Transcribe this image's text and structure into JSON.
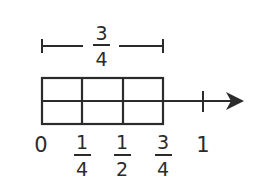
{
  "diagram": {
    "type": "fraction-number-line-with-area-model",
    "measure_bracket": {
      "numerator": "3",
      "denominator": "4"
    },
    "area_model": {
      "columns": 3,
      "rows": 2
    },
    "number_line": {
      "tick_labels": [
        {
          "whole": "0"
        },
        {
          "numerator": "1",
          "denominator": "4"
        },
        {
          "numerator": "1",
          "denominator": "2"
        },
        {
          "numerator": "3",
          "denominator": "4"
        },
        {
          "whole": "1"
        }
      ],
      "has_arrow": true
    },
    "colors": {
      "stroke": "#2b2b2b",
      "background": "#ffffff"
    }
  }
}
